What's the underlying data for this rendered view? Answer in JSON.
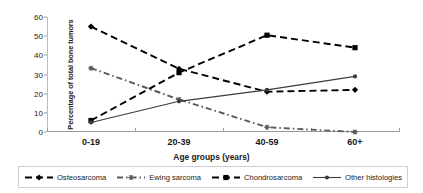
{
  "chart_data": {
    "type": "line",
    "title": "",
    "xlabel": "Age groups (years)",
    "ylabel": "Percentage of total bone tumors",
    "categories": [
      "0-19",
      "20-39",
      "40-59",
      "60+"
    ],
    "ylim": [
      0,
      60
    ],
    "yticks": [
      0,
      10,
      20,
      30,
      40,
      50,
      60
    ],
    "grid": false,
    "legend_position": "bottom",
    "series": [
      {
        "name": "Osteosarcoma",
        "values": [
          55.0,
          33.0,
          21.0,
          22.0
        ],
        "style": "dashed",
        "marker": "diamond",
        "color": "#000000"
      },
      {
        "name": "Ewing sarcoma",
        "values": [
          33.3,
          17.0,
          2.5,
          0.0
        ],
        "style": "dashdot",
        "marker": "star",
        "color": "#5a5a5a"
      },
      {
        "name": "Chondrosarcoma",
        "values": [
          6.0,
          31.0,
          50.5,
          44.0
        ],
        "style": "dashed",
        "marker": "square",
        "color": "#000000"
      },
      {
        "name": "Other histologies",
        "values": [
          5.0,
          16.0,
          22.0,
          29.0
        ],
        "style": "solid",
        "marker": "dot",
        "color": "#3b3b3b"
      }
    ]
  },
  "legend": {
    "items": [
      {
        "label": "Osteosarcoma"
      },
      {
        "label": "Ewing sarcoma"
      },
      {
        "label": "Chondrosarcoma"
      },
      {
        "label": "Other histologies"
      }
    ]
  }
}
